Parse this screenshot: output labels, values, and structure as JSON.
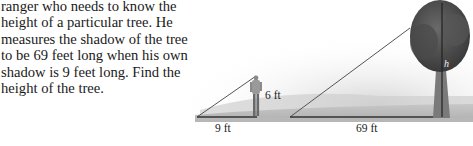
{
  "problem": {
    "lines": [
      "ranger who needs to know the",
      "height of a particular tree. He",
      "measures the shadow of the tree",
      "to be 69 feet long when his own",
      "shadow is 9 feet long. Find the",
      "height of the tree."
    ]
  },
  "figure": {
    "man_height_label": "6 ft",
    "man_shadow_label": "9 ft",
    "tree_shadow_label": "69 ft",
    "tree_height_label": "h"
  }
}
